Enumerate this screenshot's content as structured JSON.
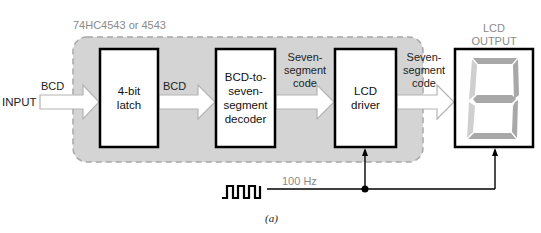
{
  "chip_label": "74HC4543 or 4543",
  "input": {
    "label": "INPUT",
    "signal": "BCD"
  },
  "blocks": [
    {
      "id": "latch",
      "lines": [
        "4-bit",
        "latch"
      ]
    },
    {
      "id": "decoder",
      "lines": [
        "BCD-to-",
        "seven-",
        "segment",
        "decoder"
      ]
    },
    {
      "id": "driver",
      "lines": [
        "LCD",
        "driver"
      ]
    }
  ],
  "connections": [
    {
      "from": "latch",
      "to": "decoder",
      "lines": [
        "BCD"
      ]
    },
    {
      "from": "decoder",
      "to": "driver",
      "lines": [
        "Seven-",
        "segment",
        "code"
      ]
    },
    {
      "from": "driver",
      "to": "lcd_output",
      "lines": [
        "Seven-",
        "segment",
        "code"
      ]
    }
  ],
  "output": {
    "title_lines": [
      "LCD",
      "OUTPUT"
    ],
    "digit_segments_shown": [
      "a",
      "b",
      "c",
      "d",
      "e",
      "f",
      "g"
    ]
  },
  "clock": {
    "frequency": "100 Hz",
    "icon": "square-wave-icon"
  },
  "caption": "(a)",
  "colors": {
    "chip_fill": "#d4d4d4",
    "chip_border": "#a8a8a8",
    "arrow_fill": "#ffffff",
    "arrow_stroke": "#b4b4b4",
    "block_border": "#000000",
    "segment_dark": "#a8a8a8",
    "segment_light": "#cfcfcf",
    "gray_text": "#8a8a8a"
  }
}
